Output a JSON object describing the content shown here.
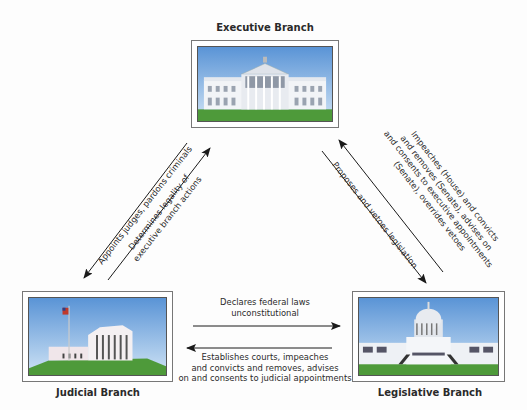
{
  "branches": {
    "executive": {
      "title": "Executive Branch",
      "image": "white-house-illustration"
    },
    "judicial": {
      "title": "Judicial Branch",
      "image": "supreme-court-illustration"
    },
    "legislative": {
      "title": "Legislative Branch",
      "image": "capitol-building-illustration"
    }
  },
  "relations": {
    "executive_to_judicial": {
      "lines": [
        "Appoints judges, pardons criminals"
      ]
    },
    "judicial_to_executive": {
      "lines": [
        "Determines legality of",
        "executive branch actions"
      ]
    },
    "legislative_to_executive": {
      "lines": [
        "Impeaches (House) and convicts",
        "and removes (Senate), advises on",
        "and consents to executive appointments",
        "(Senate), overrides vetoes"
      ]
    },
    "executive_to_legislative": {
      "lines": [
        "Proposes and vetoes legislation"
      ]
    },
    "judicial_to_legislative": {
      "lines": [
        "Declares federal laws",
        "unconstitutional"
      ]
    },
    "legislative_to_judicial": {
      "lines": [
        "Establishes courts, impeaches",
        "and convicts and removes, advises",
        "on and consents to judicial appointments"
      ]
    }
  },
  "colors": {
    "sky_top": "#5a94d6",
    "sky_bottom": "#cfe3f5",
    "grass": "#4e9a3a",
    "arrow": "#1a1a1a"
  }
}
